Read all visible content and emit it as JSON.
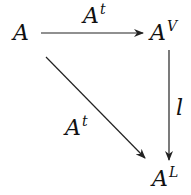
{
  "diagram": {
    "type": "commutative-diagram",
    "nodes": [
      {
        "id": "A",
        "base": "A",
        "sup": ""
      },
      {
        "id": "AV",
        "base": "A",
        "sup": "V"
      },
      {
        "id": "AL",
        "base": "A",
        "sup": "L"
      }
    ],
    "edges": [
      {
        "from": "A",
        "to": "AV",
        "label_base": "A",
        "label_sup": "t"
      },
      {
        "from": "AV",
        "to": "AL",
        "label_base": "l",
        "label_sup": ""
      },
      {
        "from": "A",
        "to": "AL",
        "label_base": "A",
        "label_sup": "t"
      }
    ],
    "line_color": "#222222"
  }
}
